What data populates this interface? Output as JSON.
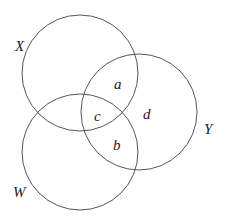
{
  "diagram": {
    "type": "venn",
    "stroke_color": "#555555",
    "sets": [
      {
        "id": "X",
        "label": "X",
        "cx": 80,
        "cy": 73,
        "r": 58,
        "label_x": 15,
        "label_y": 51
      },
      {
        "id": "Y",
        "label": "Y",
        "cx": 139,
        "cy": 112,
        "r": 58,
        "label_x": 204,
        "label_y": 134
      },
      {
        "id": "W",
        "label": "W",
        "cx": 80,
        "cy": 152,
        "r": 58,
        "label_x": 13,
        "label_y": 197
      }
    ],
    "regions": [
      {
        "id": "a",
        "label": "a",
        "x": 114,
        "y": 89,
        "description": "X ∩ Y only"
      },
      {
        "id": "c",
        "label": "c",
        "x": 94,
        "y": 121,
        "description": "X ∩ Y ∩ W"
      },
      {
        "id": "d",
        "label": "d",
        "x": 143,
        "y": 119,
        "description": "Y only"
      },
      {
        "id": "b",
        "label": "b",
        "x": 113,
        "y": 150,
        "description": "Y ∩ W only"
      }
    ]
  }
}
